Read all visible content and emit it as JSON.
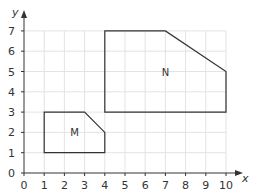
{
  "chart_data": {
    "type": "diagram",
    "title": "",
    "xlabel": "x",
    "ylabel": "y",
    "xlim": [
      0,
      10
    ],
    "ylim": [
      0,
      7
    ],
    "grid": true,
    "x_ticks": [
      "0",
      "1",
      "2",
      "3",
      "4",
      "5",
      "6",
      "7",
      "8",
      "9",
      "10"
    ],
    "y_ticks": [
      "0",
      "1",
      "2",
      "3",
      "4",
      "5",
      "6",
      "7"
    ],
    "shapes": [
      {
        "name": "M",
        "label": "M",
        "label_pos": [
          2.5,
          2
        ],
        "vertices": [
          [
            1,
            1
          ],
          [
            4,
            1
          ],
          [
            4,
            2
          ],
          [
            3,
            3
          ],
          [
            1,
            3
          ]
        ]
      },
      {
        "name": "N",
        "label": "N",
        "label_pos": [
          7,
          5
        ],
        "vertices": [
          [
            4,
            3
          ],
          [
            10,
            3
          ],
          [
            10,
            5
          ],
          [
            7,
            7
          ],
          [
            4,
            7
          ]
        ]
      }
    ]
  },
  "colors": {
    "grid": "#e3e3e3",
    "axis": "#333333",
    "shape_stroke": "#333333"
  }
}
